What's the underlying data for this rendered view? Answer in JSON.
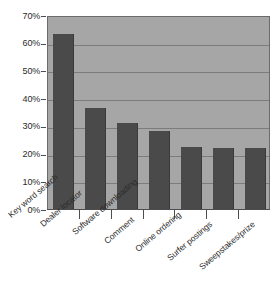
{
  "chart_data": {
    "type": "bar",
    "title": "",
    "subtitle": "",
    "xlabel": "",
    "ylabel": "",
    "categories": [
      "Key word search",
      "Dealer locator",
      "Software downloading",
      "Comment",
      "Online ordering",
      "Surfer postings",
      "Sweepstakes/prize"
    ],
    "values": [
      63,
      36.5,
      31,
      28,
      22.5,
      22,
      22
    ],
    "ylim": [
      0,
      70
    ],
    "ytick_values": [
      0,
      10,
      20,
      30,
      40,
      50,
      60,
      70
    ],
    "ytick_labels": [
      "0%",
      "10%",
      "20%",
      "30%",
      "40%",
      "50%",
      "60%",
      "70%"
    ],
    "grid": true,
    "grid_axis": "y",
    "legend": false,
    "legend_position": "none",
    "orientation": "vertical",
    "bar_color": "#4a4a4a",
    "plot_background_color": "#a6a6a6",
    "gridline_color": "#7c7c7c",
    "axis_color": "#4d4d4d",
    "text_color": "#2b2b2b",
    "figure_background_color": "#ffffff",
    "xtick_label_rotation": -40
  }
}
